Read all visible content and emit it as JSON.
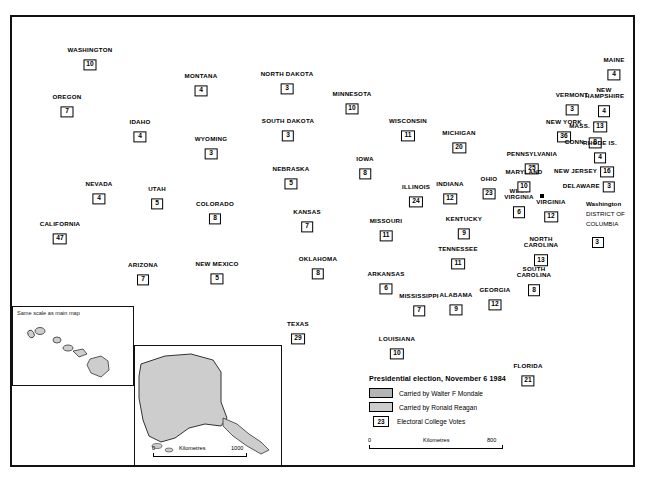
{
  "map": {
    "title_hidden": "",
    "legend": {
      "title": "Presidential election, November 6 1984",
      "mondale_label": "Carried by Walter F Mondale",
      "reagan_label": "Carried by Ronald Reagan",
      "votes_sample": "23",
      "votes_label": "Electoral College Votes",
      "mondale_color": "#b4b4b4",
      "reagan_color": "#cdcdcd"
    },
    "scale_main": {
      "min": "0",
      "label": "Kilometres",
      "max": "800"
    },
    "scale_alaska": {
      "min": "0",
      "label": "Kilometres",
      "max": "1000"
    },
    "hawaii_inset_note": "Same scale as main map",
    "dc": {
      "marker_label": "Washington",
      "line1": "DISTRICT OF",
      "line2": "COLUMBIA",
      "votes": "3"
    }
  },
  "chart_data": {
    "type": "map",
    "title": "Presidential election, November 6 1984",
    "legend": [
      "Carried by Walter F Mondale",
      "Carried by Ronald Reagan"
    ],
    "value_label": "Electoral College Votes",
    "states": [
      {
        "name": "WASHINGTON",
        "votes": "10",
        "winner": "reagan",
        "x": 90,
        "y": 59
      },
      {
        "name": "OREGON",
        "votes": "7",
        "winner": "reagan",
        "x": 67,
        "y": 106
      },
      {
        "name": "IDAHO",
        "votes": "4",
        "winner": "reagan",
        "x": 140,
        "y": 131
      },
      {
        "name": "MONTANA",
        "votes": "4",
        "winner": "reagan",
        "x": 201,
        "y": 85
      },
      {
        "name": "WYOMING",
        "votes": "3",
        "winner": "reagan",
        "x": 211,
        "y": 148
      },
      {
        "name": "NEVADA",
        "votes": "4",
        "winner": "reagan",
        "x": 99,
        "y": 193
      },
      {
        "name": "UTAH",
        "votes": "5",
        "winner": "reagan",
        "x": 157,
        "y": 198
      },
      {
        "name": "COLORADO",
        "votes": "8",
        "winner": "reagan",
        "x": 215,
        "y": 213
      },
      {
        "name": "CALIFORNIA",
        "votes": "47",
        "winner": "reagan",
        "x": 60,
        "y": 233
      },
      {
        "name": "ARIZONA",
        "votes": "7",
        "winner": "reagan",
        "x": 143,
        "y": 274
      },
      {
        "name": "NEW MEXICO",
        "votes": "5",
        "winner": "reagan",
        "x": 217,
        "y": 273
      },
      {
        "name": "NORTH DAKOTA",
        "votes": "3",
        "winner": "reagan",
        "x": 287,
        "y": 83
      },
      {
        "name": "SOUTH DAKOTA",
        "votes": "3",
        "winner": "reagan",
        "x": 288,
        "y": 130
      },
      {
        "name": "NEBRASKA",
        "votes": "5",
        "winner": "reagan",
        "x": 291,
        "y": 178
      },
      {
        "name": "KANSAS",
        "votes": "7",
        "winner": "reagan",
        "x": 307,
        "y": 221
      },
      {
        "name": "OKLAHOMA",
        "votes": "8",
        "winner": "reagan",
        "x": 318,
        "y": 268
      },
      {
        "name": "TEXAS",
        "votes": "29",
        "winner": "reagan",
        "x": 298,
        "y": 333
      },
      {
        "name": "MINNESOTA",
        "votes": "10",
        "winner": "mondale",
        "x": 352,
        "y": 103
      },
      {
        "name": "IOWA",
        "votes": "8",
        "winner": "reagan",
        "x": 365,
        "y": 168
      },
      {
        "name": "MISSOURI",
        "votes": "11",
        "winner": "reagan",
        "x": 386,
        "y": 230
      },
      {
        "name": "ARKANSAS",
        "votes": "6",
        "winner": "reagan",
        "x": 386,
        "y": 283
      },
      {
        "name": "LOUISIANA",
        "votes": "10",
        "winner": "reagan",
        "x": 397,
        "y": 348
      },
      {
        "name": "WISCONSIN",
        "votes": "11",
        "winner": "reagan",
        "x": 408,
        "y": 130
      },
      {
        "name": "ILLINOIS",
        "votes": "24",
        "winner": "reagan",
        "x": 416,
        "y": 196
      },
      {
        "name": "MISSISSIPPI",
        "votes": "7",
        "winner": "reagan",
        "x": 419,
        "y": 305
      },
      {
        "name": "INDIANA",
        "votes": "12",
        "winner": "reagan",
        "x": 450,
        "y": 193
      },
      {
        "name": "MICHIGAN",
        "votes": "20",
        "winner": "reagan",
        "x": 459,
        "y": 142
      },
      {
        "name": "KENTUCKY",
        "votes": "9",
        "winner": "reagan",
        "x": 464,
        "y": 228
      },
      {
        "name": "TENNESSEE",
        "votes": "11",
        "winner": "reagan",
        "x": 458,
        "y": 258
      },
      {
        "name": "ALABAMA",
        "votes": "9",
        "winner": "reagan",
        "x": 456,
        "y": 304
      },
      {
        "name": "OHIO",
        "votes": "23",
        "winner": "reagan",
        "x": 489,
        "y": 188
      },
      {
        "name": "GEORGIA",
        "votes": "12",
        "winner": "reagan",
        "x": 495,
        "y": 299
      },
      {
        "name": "FLORIDA",
        "votes": "21",
        "winner": "reagan",
        "x": 528,
        "y": 375
      },
      {
        "name": "WEST VIRGINIA",
        "votes": "6",
        "winner": "reagan",
        "x": 519,
        "y": 203
      },
      {
        "name": "VIRGINIA",
        "votes": "12",
        "winner": "reagan",
        "x": 551,
        "y": 211
      },
      {
        "name": "NORTH CAROLINA",
        "votes": "13",
        "winner": "reagan",
        "x": 541,
        "y": 251
      },
      {
        "name": "SOUTH CAROLINA",
        "votes": "8",
        "winner": "reagan",
        "x": 534,
        "y": 281
      },
      {
        "name": "PENNSYLVANIA",
        "votes": "25",
        "winner": "reagan",
        "x": 532,
        "y": 163
      },
      {
        "name": "MARYLAND",
        "votes": "10",
        "winner": "mondale",
        "x": 524,
        "y": 181
      },
      {
        "name": "NEW YORK",
        "votes": "36",
        "winner": "reagan",
        "x": 564,
        "y": 131
      },
      {
        "name": "VERMONT",
        "votes": "3",
        "winner": "reagan",
        "x": 572,
        "y": 104
      },
      {
        "name": "NEW HAMPSHIRE",
        "votes": "4",
        "winner": "reagan",
        "x": 604,
        "y": 102
      },
      {
        "name": "MAINE",
        "votes": "4",
        "winner": "reagan",
        "x": 614,
        "y": 69
      },
      {
        "name": "MASS.",
        "votes": "13",
        "winner": "reagan",
        "x": 588,
        "y": 127
      },
      {
        "name": "CONN.",
        "votes": "8",
        "winner": "reagan",
        "x": 583,
        "y": 143
      },
      {
        "name": "RHODE IS.",
        "votes": "4",
        "winner": "reagan",
        "x": 600,
        "y": 152
      },
      {
        "name": "NEW JERSEY",
        "votes": "16",
        "winner": "reagan",
        "x": 584,
        "y": 172
      },
      {
        "name": "DELAWARE",
        "votes": "3",
        "winner": "reagan",
        "x": 589,
        "y": 187
      },
      {
        "name": "ALASKA",
        "votes": "3",
        "winner": "reagan",
        "x": 176,
        "y": 393
      },
      {
        "name": "HAWAII",
        "votes": "4",
        "winner": "reagan",
        "x": 63,
        "y": 364
      }
    ]
  }
}
